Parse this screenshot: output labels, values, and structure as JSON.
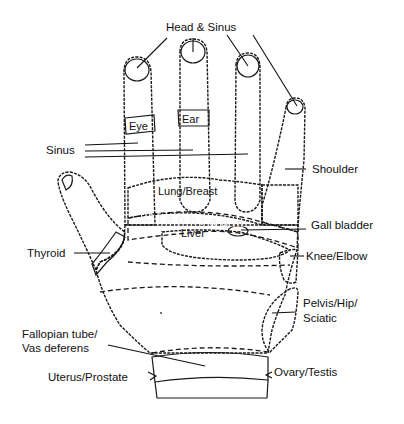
{
  "colors": {
    "background": "#ffffff",
    "light_zone": "#b8b8b8",
    "medium_zone": "#8f8f8f",
    "dark_zone": "#6e6e6e",
    "darkest_zone": "#2e2e2e",
    "outline": "#1a1a1a"
  },
  "labels": {
    "head_sinus": "Head & Sinus",
    "sinus": "Sinus",
    "eye": "Eye",
    "ear": "Ear",
    "shoulder": "Shoulder",
    "lung_breast": "Lung/Breast",
    "diaphragm": "Diaphragm",
    "liver": "Liver",
    "gall_bladder": "Gall bladder",
    "thyroid": "Thyroid",
    "knee_elbow": "Knee/Elbow",
    "pelvis_line1": "Pelvis/Hip/",
    "pelvis_line2": "Sciatic",
    "fallopian_line1": "Fallopian tube/",
    "fallopian_line2": "Vas deferens",
    "uterus_prostate": "Uterus/Prostate",
    "ovary_testis": "Ovary/Testis"
  }
}
